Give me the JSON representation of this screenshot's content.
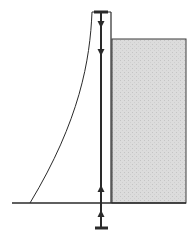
{
  "diagram": {
    "colors": {
      "ink": "#2a2a2a",
      "fill": "#d9d9d9",
      "background": "#ffffff"
    },
    "ground_line": {
      "x1": 12,
      "x2": 186,
      "y": 203
    },
    "frame": {
      "left_x": 92,
      "right_x": 111,
      "top_y": 12
    },
    "central_rod": {
      "x": 101,
      "y1": 12,
      "y2": 228
    },
    "top_plate": {
      "x1": 94,
      "x2": 108,
      "y": 12
    },
    "bottom_plate": {
      "x1": 95,
      "x2": 108,
      "y": 228
    },
    "shaded_block": {
      "x": 112,
      "y": 39,
      "width": 74,
      "height": 164
    },
    "curve": {
      "path": "M 92 12 C 90 60, 80 120, 30 203"
    },
    "arrows_down": [
      25,
      53
    ],
    "arrows_up": [
      188,
      213
    ]
  }
}
